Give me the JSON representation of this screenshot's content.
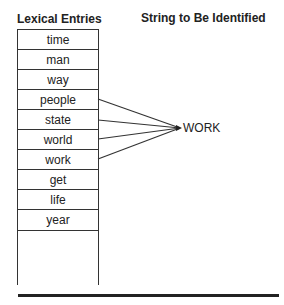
{
  "headers": {
    "left": "Lexical Entries",
    "right": "String to Be Identified"
  },
  "entries": [
    "time",
    "man",
    "way",
    "people",
    "state",
    "world",
    "work",
    "get",
    "life",
    "year"
  ],
  "target": "WORK",
  "connected_entries": [
    "people",
    "state",
    "world",
    "work"
  ],
  "colors": {
    "line": "#333333",
    "text": "#222222"
  }
}
